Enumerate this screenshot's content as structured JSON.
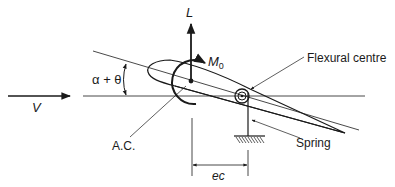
{
  "diagram": {
    "type": "aerofoil-torsional-divergence-schematic",
    "labels": {
      "velocity": "V",
      "angle": "α + θ",
      "lift": "L",
      "moment": "M",
      "moment_subscript": "0",
      "aerodynamic_centre": "A.C.",
      "flexural_centre": "Flexural centre",
      "spring": "Spring",
      "dimension": "ec"
    },
    "colors": {
      "ink": "#1a1a1a",
      "background": "#ffffff"
    }
  }
}
